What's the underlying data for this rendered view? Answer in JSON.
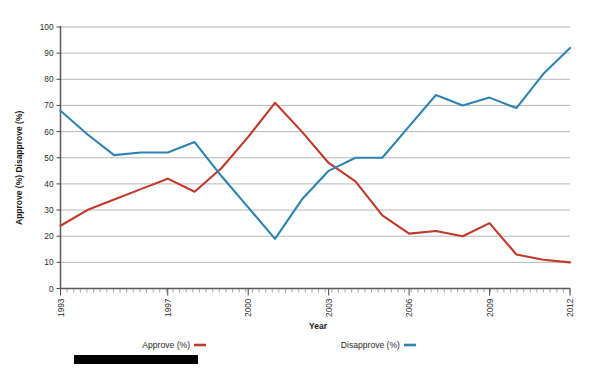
{
  "chart_data": {
    "type": "line",
    "title": "",
    "subtitle": "",
    "xlabel": "Year",
    "ylabel": "Approve (%) Disapprove (%)",
    "xlim": [
      1993,
      2012
    ],
    "ylim": [
      0,
      100
    ],
    "grid": true,
    "legend_position": "bottom",
    "y_ticks": [
      0,
      10,
      20,
      30,
      40,
      50,
      60,
      70,
      80,
      90,
      100
    ],
    "x_ticks": [
      1993,
      1997,
      2000,
      2003,
      2006,
      2009,
      2012
    ],
    "x_tick_labels": [
      "1993",
      "1997",
      "2000",
      "2003",
      "2006",
      "2009",
      "2012"
    ],
    "x": [
      1993,
      1994,
      1995,
      1996,
      1997,
      1998,
      1999,
      2000,
      2001,
      2002,
      2003,
      2004,
      2005,
      2006,
      2007,
      2008,
      2009,
      2010,
      2011,
      2012
    ],
    "series": [
      {
        "name": "Approve (%)",
        "color": "#C0392B",
        "values": [
          24,
          30,
          34,
          38,
          42,
          37,
          46,
          58,
          71,
          60,
          48,
          41,
          28,
          21,
          22,
          20,
          25,
          13,
          11,
          10
        ]
      },
      {
        "name": "Disapprove (%)",
        "color": "#2E84B0",
        "values": [
          68,
          59,
          51,
          52,
          52,
          56,
          43,
          31,
          19,
          34,
          45,
          50,
          50,
          62,
          74,
          70,
          73,
          69,
          82,
          92
        ]
      }
    ]
  },
  "axis": {
    "y_title": "Approve (%) Disapprove (%)",
    "x_title": "Year"
  },
  "legend": {
    "items": [
      {
        "label": "Approve (%)",
        "color": "#C0392B"
      },
      {
        "label": "Disapprove (%)",
        "color": "#2E84B0"
      }
    ]
  },
  "y_tick_labels": [
    "100",
    "90",
    "80",
    "70",
    "60",
    "50",
    "40",
    "30",
    "20",
    "10",
    "0"
  ],
  "colors": {
    "approve": "#C0392B",
    "disapprove": "#2E84B0",
    "grid": "#9a9a9a",
    "axis": "#5a5a5a",
    "background": "#ffffff",
    "redaction": "#000000"
  },
  "redaction": {
    "present": true
  }
}
